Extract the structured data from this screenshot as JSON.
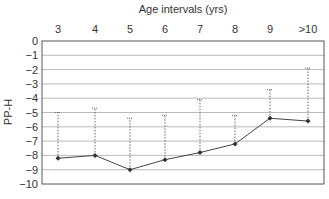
{
  "chart_data": {
    "type": "line",
    "title": "Age intervals (yrs)",
    "xlabel": "Age intervals (yrs)",
    "ylabel": "PP-H",
    "categories": [
      "3",
      "4",
      "5",
      "6",
      "7",
      "8",
      "9",
      ">10"
    ],
    "series": [
      {
        "name": "PP-H",
        "values": [
          -8.2,
          -8.0,
          -9.0,
          -8.3,
          -7.8,
          -7.2,
          -5.4,
          -5.6
        ],
        "style": "solid line with diamond markers"
      },
      {
        "name": "upper range (dotted whisker)",
        "values": [
          -5.0,
          -4.7,
          -5.4,
          -5.2,
          -4.1,
          -5.2,
          -3.4,
          -1.9
        ],
        "style": "dotted vertical line from point with small cap"
      }
    ],
    "yticks": [
      0,
      -1,
      -2,
      -3,
      -4,
      -5,
      -6,
      -7,
      -8,
      -9,
      -10
    ],
    "ylim": [
      -10,
      0
    ],
    "grid": true,
    "xaxis_position": "top",
    "legend": null,
    "colors": {
      "line": "#333333",
      "grid": "#bbbbbb",
      "whisker": "#666666"
    }
  }
}
